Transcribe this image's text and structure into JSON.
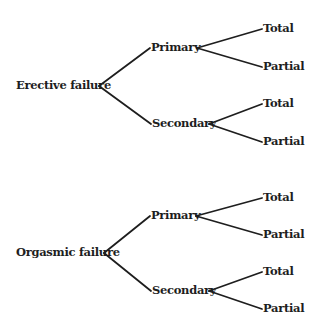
{
  "trees": [
    {
      "root": {
        "label": "Erective failure",
        "x": 16,
        "y": 86,
        "apex_x": 99
      },
      "branches": [
        {
          "label": "Primary",
          "x": 151,
          "y": 48,
          "apex_x": 197,
          "leaves": [
            {
              "label": "Total",
              "x": 263,
              "y": 29
            },
            {
              "label": "Partial",
              "x": 263,
              "y": 67
            }
          ]
        },
        {
          "label": "Secondary",
          "x": 152,
          "y": 124,
          "apex_x": 209,
          "leaves": [
            {
              "label": "Total",
              "x": 263,
              "y": 104
            },
            {
              "label": "Partial",
              "x": 263,
              "y": 142
            }
          ]
        }
      ]
    },
    {
      "root": {
        "label": "Orgasmic failure",
        "x": 16,
        "y": 253,
        "apex_x": 104
      },
      "branches": [
        {
          "label": "Primary",
          "x": 151,
          "y": 216,
          "apex_x": 196,
          "leaves": [
            {
              "label": "Total",
              "x": 263,
              "y": 198
            },
            {
              "label": "Partial",
              "x": 263,
              "y": 235
            }
          ]
        },
        {
          "label": "Secondary",
          "x": 152,
          "y": 291,
          "apex_x": 209,
          "leaves": [
            {
              "label": "Total",
              "x": 263,
              "y": 272
            },
            {
              "label": "Partial",
              "x": 263,
              "y": 309
            }
          ]
        }
      ]
    }
  ],
  "colors": {
    "ink": "#1e1e1e",
    "background": "#ffffff"
  }
}
